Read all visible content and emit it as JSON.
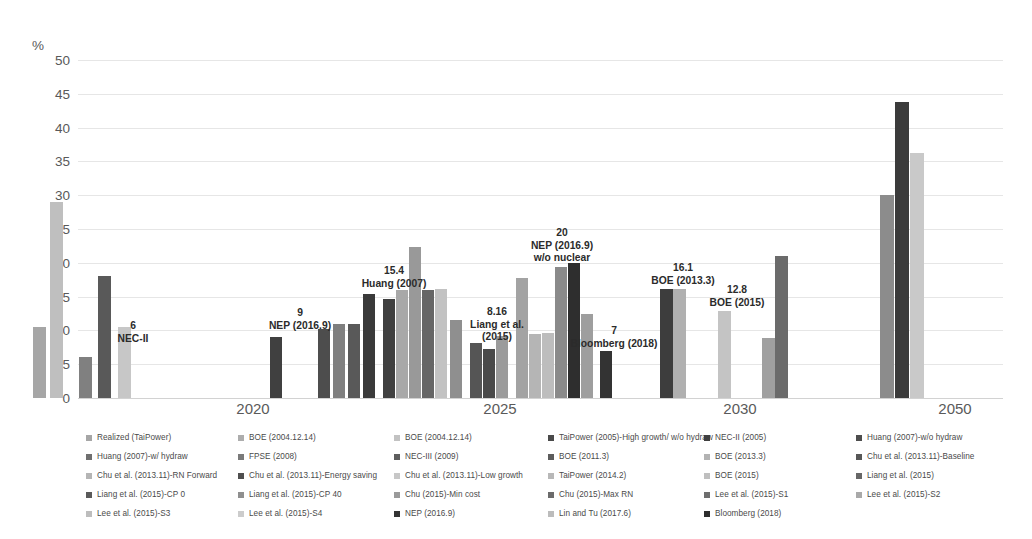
{
  "axis": {
    "unit_label": "%",
    "y_ticks": [
      0,
      5,
      10,
      15,
      20,
      25,
      30,
      35,
      40,
      45,
      50
    ],
    "y_min": 0,
    "y_max": 50,
    "x_labels": [
      "2020",
      "2025",
      "2030",
      "2050"
    ]
  },
  "chart_data": {
    "type": "bar",
    "title": "",
    "xlabel": "",
    "ylabel": "%",
    "ylim": [
      0,
      50
    ],
    "grid": true,
    "legend_position": "bottom",
    "categories": [
      "2020",
      "2025",
      "2030",
      "2050"
    ],
    "groups": [
      {
        "category": "2020",
        "bars": [
          {
            "series": "Realized (TaiPower)",
            "value": 10.5,
            "color": "#a6a6a6"
          },
          {
            "series": "BOE (2004.12.14)",
            "value": 29.0,
            "color": "#bfbfbf"
          },
          {
            "series": "NEC-II (2005)",
            "value": 6.0,
            "color": "#808080"
          },
          {
            "series": "Huang (2007)-w/o hydraw",
            "value": 18.0,
            "color": "#595959"
          },
          {
            "series": "Huang (2007)-w/ hydraw",
            "value": 10.5,
            "color": "#c7c7c7"
          }
        ]
      },
      {
        "category": "2025",
        "bars": [
          {
            "series": "NEP (2016.9)",
            "value": 9.0,
            "color": "#404040"
          },
          {
            "series": "BOE (2004.12.14)",
            "value": 10.2,
            "color": "#4d4d4d"
          },
          {
            "series": "FPSE (2008)",
            "value": 11.0,
            "color": "#7f7f7f"
          },
          {
            "series": "NEC-III (2009)",
            "value": 11.0,
            "color": "#595959"
          },
          {
            "series": "Huang (2007)",
            "value": 15.4,
            "color": "#3a3a3a"
          },
          {
            "series": "Chu et al. (2013.11)-Baseline",
            "value": 14.6,
            "color": "#404040"
          },
          {
            "series": "Chu et al. (2013.11)-RN Forward",
            "value": 16.0,
            "color": "#a8a8a8"
          },
          {
            "series": "Chu et al. (2013.11)-Energy saving",
            "value": 22.3,
            "color": "#999999"
          },
          {
            "series": "Chu et al. (2013.11)-Low growth",
            "value": 16.0,
            "color": "#666666"
          },
          {
            "series": "TaiPower (2005)-High growth/ w/o hydraw",
            "value": 16.2,
            "color": "#c2c2c2"
          },
          {
            "series": "BOE (2011.3)",
            "value": 11.6,
            "color": "#8f8f8f"
          },
          {
            "series": "Liang et al. (2015)",
            "value": 8.16,
            "color": "#555555"
          },
          {
            "series": "Liang et al. (2015)-CP 0",
            "value": 7.2,
            "color": "#4a4a4a"
          },
          {
            "series": "Liang et al. (2015)-CP 40",
            "value": 9.2,
            "color": "#9b9b9b"
          },
          {
            "series": "Chu (2015)-Min cost",
            "value": 17.8,
            "color": "#a3a3a3"
          },
          {
            "series": "Chu (2015)-Max RN",
            "value": 9.5,
            "color": "#b5b5b5"
          },
          {
            "series": "TaiPower (2014.2)",
            "value": 9.6,
            "color": "#bdbdbd"
          },
          {
            "series": "Lee et al. (2015)-S1",
            "value": 19.4,
            "color": "#8a8a8a"
          },
          {
            "series": "NEP (2016.9) w/o nuclear",
            "value": 20.0,
            "color": "#2e2e2e"
          },
          {
            "series": "Lee et al. (2015)-S2",
            "value": 12.4,
            "color": "#9e9e9e"
          },
          {
            "series": "Bloomberg (2018)",
            "value": 7.0,
            "color": "#333333"
          }
        ]
      },
      {
        "category": "2030",
        "bars": [
          {
            "series": "BOE (2013.3)",
            "value": 16.1,
            "color": "#3d3d3d"
          },
          {
            "series": "BOE (2013.3)",
            "value": 16.1,
            "color": "#b0b0b0"
          },
          {
            "series": "BOE (2015)",
            "value": 12.8,
            "color": "#c4c4c4"
          },
          {
            "series": "Lee et al. (2015)-S3",
            "value": 8.9,
            "color": "#a0a0a0"
          },
          {
            "series": "Lin and Tu (2017.6)",
            "value": 21.0,
            "color": "#6b6b6b"
          }
        ]
      },
      {
        "category": "2050",
        "bars": [
          {
            "series": "Lee et al. (2015)-S4",
            "value": 30.0,
            "color": "#8c8c8c"
          },
          {
            "series": "Chu et al. (2013.11)",
            "value": 43.8,
            "color": "#3b3b3b"
          },
          {
            "series": "Liang et al. (2015)",
            "value": 36.2,
            "color": "#c9c9c9"
          }
        ]
      }
    ],
    "annotations": [
      {
        "value": "6",
        "label": "NEC-II",
        "lines": [
          "6",
          "NEC-II"
        ]
      },
      {
        "value": "9",
        "label": "NEP (2016.9)",
        "lines": [
          "9",
          "NEP (2016.9)"
        ]
      },
      {
        "value": "15.4",
        "label": "Huang (2007)",
        "lines": [
          "15.4",
          "Huang (2007)"
        ]
      },
      {
        "value": "8.16",
        "label": "Liang et al. (2015)",
        "lines": [
          "8.16",
          "Liang et al.",
          "(2015)"
        ]
      },
      {
        "value": "20",
        "label": "NEP (2016.9) w/o nuclear",
        "lines": [
          "20",
          "NEP (2016.9)",
          "w/o nuclear"
        ]
      },
      {
        "value": "7",
        "label": "Bloomberg (2018)",
        "lines": [
          "7",
          "Bloomberg (2018)"
        ]
      },
      {
        "value": "16.1",
        "label": "BOE (2013.3)",
        "lines": [
          "16.1",
          "BOE (2013.3)"
        ]
      },
      {
        "value": "12.8",
        "label": "BOE (2015)",
        "lines": [
          "12.8",
          "BOE (2015)"
        ]
      }
    ]
  },
  "annotation_items": [
    {
      "l1": "6",
      "l2": "NEC-II",
      "l3": ""
    },
    {
      "l1": "9",
      "l2": "NEP (2016.9)",
      "l3": ""
    },
    {
      "l1": "15.4",
      "l2": "Huang (2007)",
      "l3": ""
    },
    {
      "l1": "8.16",
      "l2": "Liang et al.",
      "l3": "(2015)"
    },
    {
      "l1": "20",
      "l2": "NEP (2016.9)",
      "l3": "w/o nuclear"
    },
    {
      "l1": "7",
      "l2": "Bloomberg (2018)",
      "l3": ""
    },
    {
      "l1": "16.1",
      "l2": "BOE (2013.3)",
      "l3": ""
    },
    {
      "l1": "12.8",
      "l2": "BOE (2015)",
      "l3": ""
    }
  ],
  "legend": {
    "columns": [
      {
        "items": [
          {
            "label": "Realized (TaiPower)",
            "color": "#a6a6a6"
          },
          {
            "label": "Huang (2007)-w/ hydraw",
            "color": "#6f6f6f"
          },
          {
            "label": "Chu et al. (2013.11)-RN Forward",
            "color": "#b5b5b5"
          },
          {
            "label": "Liang et al. (2015)-CP 0",
            "color": "#5a5a5a"
          },
          {
            "label": "Lee et al. (2015)-S3",
            "color": "#bdbdbd"
          }
        ]
      },
      {
        "items": [
          {
            "label": "BOE (2004.12.14)",
            "color": "#adadad"
          },
          {
            "label": "FPSE (2008)",
            "color": "#7a7a7a"
          },
          {
            "label": "Chu et al. (2013.11)-Energy saving",
            "color": "#4f4f4f"
          },
          {
            "label": "Liang et al. (2015)-CP 40",
            "color": "#8f8f8f"
          },
          {
            "label": "Lee et al. (2015)-S4",
            "color": "#cccccc"
          }
        ]
      },
      {
        "items": [
          {
            "label": "BOE (2004.12.14)",
            "color": "#c2c2c2"
          },
          {
            "label": "NEC-III (2009)",
            "color": "#5e5e5e"
          },
          {
            "label": "Chu et al. (2013.11)-Low growth",
            "color": "#c7c7c7"
          },
          {
            "label": "Chu (2015)-Min cost",
            "color": "#9a9a9a"
          },
          {
            "label": "NEP (2016.9)",
            "color": "#333333"
          }
        ]
      },
      {
        "items": [
          {
            "label": "TaiPower (2005)-High growth/ w/o hydraw",
            "color": "#4a4a4a"
          },
          {
            "label": "BOE (2011.3)",
            "color": "#5c5c5c"
          },
          {
            "label": "TaiPower (2014.2)",
            "color": "#b8b8b8"
          },
          {
            "label": "Chu (2015)-Max RN",
            "color": "#6b6b6b"
          },
          {
            "label": "Lin and Tu (2017.6)",
            "color": "#bcbcbc"
          }
        ]
      },
      {
        "items": [
          {
            "label": "NEC-II (2005)",
            "color": "#3f3f3f"
          },
          {
            "label": "BOE (2013.3)",
            "color": "#b3b3b3"
          },
          {
            "label": "BOE (2015)",
            "color": "#bfbfbf"
          },
          {
            "label": "Lee et al. (2015)-S1",
            "color": "#6e6e6e"
          },
          {
            "label": "Bloomberg (2018)",
            "color": "#2e2e2e"
          }
        ]
      },
      {
        "items": [
          {
            "label": "Huang (2007)-w/o hydraw",
            "color": "#4d4d4d"
          },
          {
            "label": "Chu et al. (2013.11)-Baseline",
            "color": "#575757"
          },
          {
            "label": "Liang et al. (2015)",
            "color": "#676767"
          },
          {
            "label": "Lee et al. (2015)-S2",
            "color": "#a9a9a9"
          }
        ]
      }
    ]
  }
}
